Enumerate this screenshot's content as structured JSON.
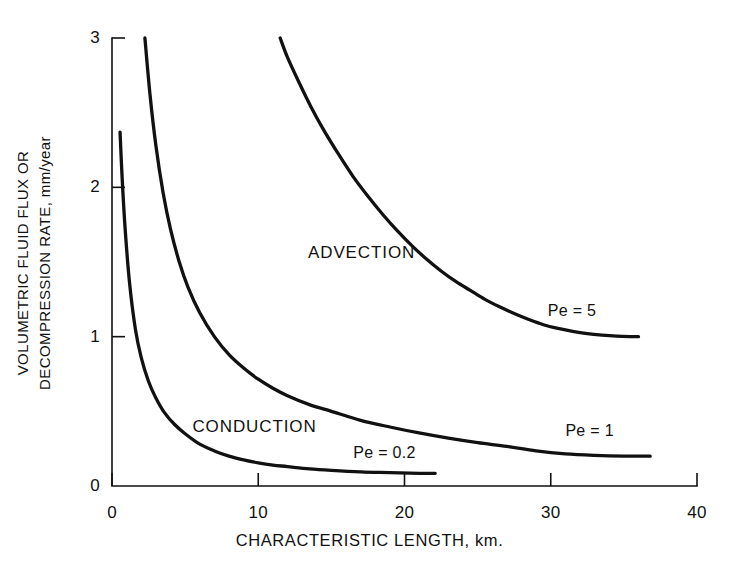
{
  "chart_data": {
    "type": "line",
    "title": "",
    "xlabel": "CHARACTERISTIC LENGTH, km.",
    "ylabel_line1": "VOLUMETRIC FLUID FLUX OR",
    "ylabel_line2": "DECOMPRESSION RATE, mm/year",
    "xlim": [
      0,
      40
    ],
    "ylim": [
      0,
      3
    ],
    "xticks": [
      0,
      10,
      20,
      30,
      40
    ],
    "yticks": [
      0,
      1,
      2,
      3
    ],
    "xtick_labels": [
      "0",
      "10",
      "20",
      "30",
      "40"
    ],
    "ytick_labels": [
      "0",
      "1",
      "2",
      "3"
    ],
    "grid": false,
    "legend": "inline-curve-labels",
    "series": [
      {
        "name": "Pe = 0.2",
        "label": "Pe = 0.2",
        "label_x": 16.5,
        "label_y": 0.28,
        "x": [
          0.55,
          0.7,
          0.9,
          1.2,
          1.6,
          2.0,
          2.5,
          3.0,
          3.6,
          4.3,
          5.0,
          6.0,
          7.0,
          8.0,
          9.0,
          10.0,
          11.0,
          12.0,
          13.5,
          15.0,
          17.0,
          19.0,
          21.0,
          22.1
        ],
        "y": [
          2.37,
          2.05,
          1.72,
          1.36,
          1.05,
          0.86,
          0.7,
          0.59,
          0.49,
          0.41,
          0.35,
          0.28,
          0.235,
          0.2,
          0.175,
          0.155,
          0.14,
          0.13,
          0.115,
          0.105,
          0.095,
          0.09,
          0.085,
          0.085
        ]
      },
      {
        "name": "Pe = 1",
        "label": "Pe = 1",
        "label_x": 31.0,
        "label_y": 0.43,
        "x": [
          2.25,
          2.6,
          3.0,
          3.5,
          4.0,
          4.6,
          5.2,
          6.0,
          7.0,
          8.0,
          9.0,
          10.0,
          11.0,
          12.0,
          13.5,
          15.0,
          17.0,
          19.0,
          21.0,
          23.0,
          25.0,
          27.0,
          29.0,
          31.0,
          33.0,
          35.0,
          36.8
        ],
        "y": [
          3.0,
          2.62,
          2.28,
          1.96,
          1.72,
          1.5,
          1.33,
          1.16,
          1.0,
          0.88,
          0.79,
          0.715,
          0.655,
          0.605,
          0.545,
          0.5,
          0.44,
          0.395,
          0.355,
          0.32,
          0.29,
          0.265,
          0.235,
          0.215,
          0.205,
          0.2,
          0.2
        ]
      },
      {
        "name": "Pe = 5",
        "label": "Pe = 5",
        "label_x": 29.8,
        "label_y": 1.23,
        "x": [
          11.5,
          12.0,
          12.8,
          13.6,
          14.5,
          15.5,
          16.5,
          17.5,
          18.5,
          19.5,
          20.5,
          21.5,
          22.5,
          23.5,
          24.5,
          25.5,
          26.5,
          27.5,
          28.5,
          29.5,
          30.5,
          31.5,
          32.5,
          33.5,
          34.5,
          35.5,
          36.0
        ],
        "y": [
          3.0,
          2.87,
          2.7,
          2.54,
          2.38,
          2.22,
          2.07,
          1.94,
          1.82,
          1.71,
          1.61,
          1.52,
          1.44,
          1.37,
          1.31,
          1.25,
          1.2,
          1.155,
          1.115,
          1.08,
          1.055,
          1.035,
          1.02,
          1.01,
          1.003,
          1.0,
          1.0
        ]
      }
    ],
    "region_labels": [
      {
        "text": "ADVECTION",
        "x": 13.4,
        "y": 1.63
      },
      {
        "text": "CONDUCTION",
        "x": 5.5,
        "y": 0.46
      }
    ],
    "colors": {
      "curve": "#111111",
      "axis": "#111111",
      "background": "#ffffff"
    }
  }
}
